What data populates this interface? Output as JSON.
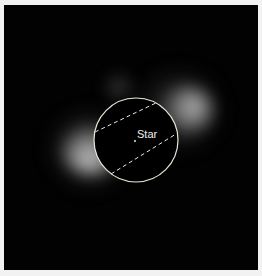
{
  "image": {
    "description": "Astronomical image of dust ring around a star with occulting mask",
    "label": "Star",
    "colors": {
      "background": "#020202",
      "border": "#f2f2f2",
      "overlay": "#e8e8d8"
    }
  }
}
